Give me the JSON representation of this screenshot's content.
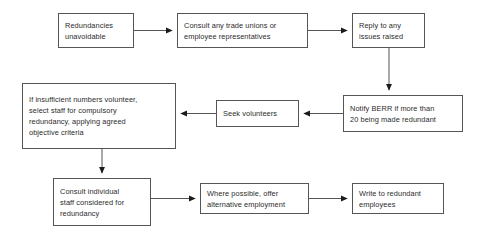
{
  "diagram": {
    "type": "flowchart",
    "background_color": "#ffffff",
    "box_border_color": "#555555",
    "text_color": "#2b2b2b",
    "connector_color": "#555555",
    "nodes": [
      {
        "id": "redundancies-unavoidable",
        "label": "Redundancies\nunavoidable"
      },
      {
        "id": "consult-unions",
        "label": "Consult any trade unions or\nemployee representatives"
      },
      {
        "id": "reply-issues",
        "label": "Reply to any\nissues raised"
      },
      {
        "id": "notify-berr",
        "label": "Notify BERR if more than\n20 being made redundant"
      },
      {
        "id": "seek-volunteers",
        "label": "Seek volunteers"
      },
      {
        "id": "insufficient-numbers",
        "label": "If insufficient numbers volunteer,\nselect staff for compulsory\nredundancy, applying agreed\nobjective criteria"
      },
      {
        "id": "consult-individual",
        "label": "Consult individual\nstaff considered for\nredundancy"
      },
      {
        "id": "alternative-employment",
        "label": "Where possible, offer\nalternative employment"
      },
      {
        "id": "write-redundant",
        "label": "Write to redundant\nemployees"
      }
    ],
    "edges": [
      {
        "from": "redundancies-unavoidable",
        "to": "consult-unions",
        "direction": "right"
      },
      {
        "from": "consult-unions",
        "to": "reply-issues",
        "direction": "right"
      },
      {
        "from": "reply-issues",
        "to": "notify-berr",
        "direction": "down"
      },
      {
        "from": "notify-berr",
        "to": "seek-volunteers",
        "direction": "left"
      },
      {
        "from": "seek-volunteers",
        "to": "insufficient-numbers",
        "direction": "left"
      },
      {
        "from": "insufficient-numbers",
        "to": "consult-individual",
        "direction": "down"
      },
      {
        "from": "consult-individual",
        "to": "alternative-employment",
        "direction": "right"
      },
      {
        "from": "alternative-employment",
        "to": "write-redundant",
        "direction": "right"
      }
    ]
  }
}
